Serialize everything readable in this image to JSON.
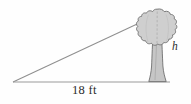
{
  "figure": {
    "background_color": "#fefefe",
    "line_color": "#8a8a8a",
    "outline_color": "#6e6e6e",
    "canopy_fill": "#cfcfcf",
    "trunk_fill": "#c6c6c6",
    "text_color": "#2b2b2b"
  },
  "labels": {
    "base": "18 ft",
    "height": "h"
  },
  "geometry": {
    "left_vertex": [
      13,
      82
    ],
    "right_vertex": [
      168,
      82
    ],
    "apex": [
      150,
      18
    ],
    "baseline_y": 82,
    "tree_center_x": 157,
    "canopy_top_y": 10,
    "canopy_bottom_y": 48,
    "trunk_base_y": 82
  },
  "icons": {
    "tree": "tree-icon",
    "triangle": "triangle-icon"
  }
}
